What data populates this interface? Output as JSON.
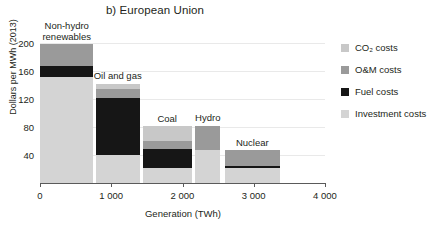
{
  "chart_data": {
    "type": "bar",
    "title": "b) European Union",
    "xlabel": "Generation (TWh)",
    "ylabel": "Dollars per MWh (2013)",
    "xlim": [
      0,
      4000
    ],
    "ylim": [
      0,
      210
    ],
    "xticks": [
      0,
      1000,
      2000,
      3000,
      4000
    ],
    "xtick_labels": [
      "0",
      "1 000",
      "2 000",
      "3 000",
      "4 000"
    ],
    "yticks": [
      40,
      80,
      120,
      160,
      200
    ],
    "ytick_labels": [
      "40",
      "80",
      "120",
      "160",
      "200"
    ],
    "grid": "horizontal",
    "stacked": true,
    "orientation": "variable-width-stacked",
    "legend_position": "right",
    "series": [
      {
        "name": "CO₂ costs",
        "key": "co2",
        "color": "#c8c8c8"
      },
      {
        "name": "O&M costs",
        "key": "om",
        "color": "#9a9a9a"
      },
      {
        "name": "Fuel costs",
        "key": "fuel",
        "color": "#161616"
      },
      {
        "name": "Investment costs",
        "key": "investment",
        "color": "#d4d4d4"
      }
    ],
    "categories": [
      {
        "label": "Non-hydro\nrenewables",
        "x_start": 0,
        "x_end": 750,
        "investment": 152,
        "fuel": 15,
        "om": 31,
        "co2": 0,
        "total": 198
      },
      {
        "label": "Oil and gas",
        "x_start": 780,
        "x_end": 1400,
        "investment": 40,
        "fuel": 81,
        "om": 13,
        "co2": 8,
        "total": 142
      },
      {
        "label": "Coal",
        "x_start": 1440,
        "x_end": 2130,
        "investment": 22,
        "fuel": 26,
        "om": 12,
        "co2": 21,
        "total": 81
      },
      {
        "label": "Hydro",
        "x_start": 2180,
        "x_end": 2530,
        "investment": 47,
        "fuel": 0,
        "om": 35,
        "co2": 0,
        "total": 82
      },
      {
        "label": "Nuclear",
        "x_start": 2590,
        "x_end": 3370,
        "investment": 21,
        "fuel": 4,
        "om": 22,
        "co2": 0,
        "total": 47
      }
    ]
  }
}
